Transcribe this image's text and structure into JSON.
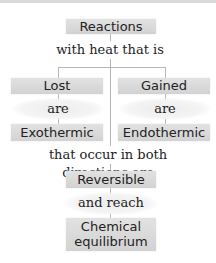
{
  "diagram": {
    "nodes": {
      "reactions": "Reactions",
      "lost": "Lost",
      "gained": "Gained",
      "exothermic": "Exothermic",
      "endothermic": "Endothermic",
      "reversible": "Reversible",
      "equilibrium_line1": "Chemical",
      "equilibrium_line2": "equilibrium"
    },
    "links": {
      "with_heat": "with heat that is",
      "are_left": "are",
      "are_right": "are",
      "both_directions": "that occur in both directions are",
      "and_reach": "and reach"
    }
  }
}
